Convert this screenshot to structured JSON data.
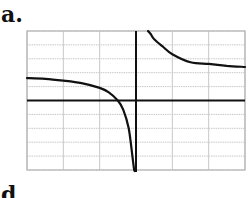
{
  "panels": [
    {
      "label": "a."
    },
    {
      "label": "d"
    }
  ],
  "chart_data": {
    "type": "line",
    "title": "",
    "panel_label": "a.",
    "xlabel": "",
    "ylabel": "",
    "xlim": [
      -3,
      3
    ],
    "ylim": [
      -5,
      5
    ],
    "grid": true,
    "grid_x_step": 1,
    "grid_y_step": 0.7143,
    "axes_visible": true,
    "ticks_labeled": false,
    "legend": null,
    "asymptotes": {
      "vertical_x": 0.1,
      "horizontal_y": 2
    },
    "series": [
      {
        "name": "left-branch",
        "x": [
          -3.0,
          -2.5,
          -2.0,
          -1.5,
          -1.0,
          -0.75,
          -0.5,
          -0.35,
          -0.2,
          -0.1,
          -0.05,
          -0.02
        ],
        "y": [
          1.61,
          1.56,
          1.43,
          1.25,
          0.91,
          0.59,
          0.0,
          -0.67,
          -2.0,
          -4.0,
          -5.0,
          -5.0
        ]
      },
      {
        "name": "right-branch",
        "x": [
          0.33,
          0.4,
          0.5,
          0.75,
          1.0,
          1.5,
          2.0,
          2.5,
          3.0
        ],
        "y": [
          5.0,
          4.8,
          4.4,
          3.85,
          3.33,
          2.75,
          2.63,
          2.5,
          2.41
        ]
      }
    ],
    "colors": {
      "curve": "#111111",
      "axis": "#111111",
      "grid": "#c8c8c8",
      "frame": "#b4b4b4"
    }
  }
}
